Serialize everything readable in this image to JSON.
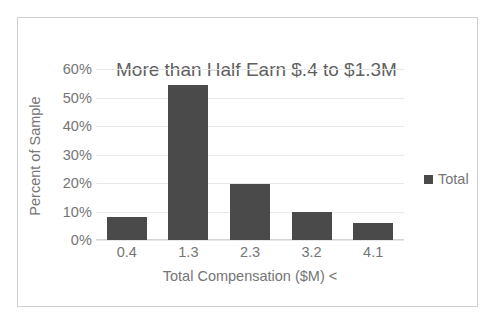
{
  "chart_data": {
    "type": "bar",
    "title": "More than Half Earn $.4 to $1.3M",
    "xlabel": "Total Compensation ($M) <",
    "ylabel": "Percent of Sample",
    "categories": [
      "0.4",
      "1.3",
      "2.3",
      "3.2",
      "4.1"
    ],
    "series": [
      {
        "name": "Total",
        "values": [
          8,
          54.5,
          19.5,
          10,
          6
        ]
      }
    ],
    "y_ticks": [
      "0%",
      "10%",
      "20%",
      "30%",
      "40%",
      "50%",
      "60%"
    ],
    "y_tick_values": [
      0,
      10,
      20,
      30,
      40,
      50,
      60
    ],
    "ylim": [
      0,
      60
    ],
    "grid": true,
    "legend_position": "right",
    "legend": [
      {
        "label": "Total",
        "color": "#4a4a4a"
      }
    ],
    "bar_color": "#4a4a4a",
    "gridline_color": "#e8e8e8",
    "text_color": "#757575",
    "border_color": "#d0d0d0"
  }
}
